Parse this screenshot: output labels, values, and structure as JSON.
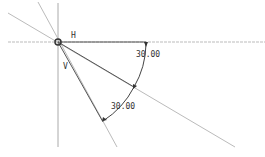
{
  "sketch": {
    "labels": {
      "h": "H",
      "v": "V"
    },
    "dimensions": [
      {
        "id": "angle-1",
        "value": "30.00"
      },
      {
        "id": "angle-2",
        "value": "30.00"
      }
    ]
  }
}
